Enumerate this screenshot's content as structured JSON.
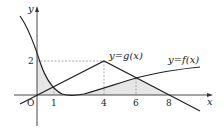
{
  "figure": {
    "axes": {
      "x_label": "x",
      "y_label": "y",
      "origin_label": "O"
    },
    "ticks": {
      "x": [
        {
          "value": 1,
          "label": "1"
        },
        {
          "value": 4,
          "label": "4"
        },
        {
          "value": 6,
          "label": "6"
        },
        {
          "value": 8,
          "label": "8"
        }
      ],
      "y": [
        {
          "value": 2,
          "label": "2"
        }
      ]
    },
    "curves": {
      "g": {
        "label": "y=g(x)",
        "type": "piecewise-linear",
        "points": [
          [
            0,
            0
          ],
          [
            4,
            2
          ],
          [
            8,
            0
          ]
        ]
      },
      "f": {
        "label": "y=f(x)",
        "type": "curve",
        "notes": "decreasing through (0,~2.2), min near x=2 on x-axis, increasing after"
      }
    },
    "intersections": [
      {
        "x": 1,
        "note": "f and g intersect"
      },
      {
        "x": 6,
        "note": "f and g intersect"
      }
    ],
    "shaded_region": "bounded by y-axis, curves f and g, and x-axis between x=0 and x=8",
    "colors": {
      "curve": "#222222",
      "shade": "#e6e6e6",
      "dash": "#888888"
    }
  }
}
